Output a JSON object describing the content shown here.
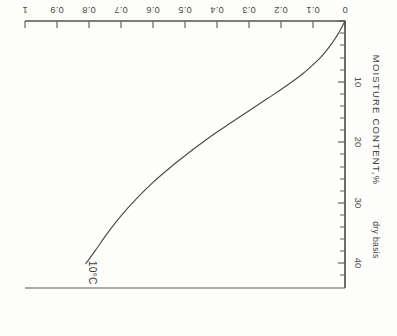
{
  "chart_data": {
    "type": "line",
    "title": "",
    "subtitle": "",
    "xlabel": "a",
    "xlabel_sub": "w",
    "xlabel_full": "a_w",
    "ylabel": "MOISTURE CONTENT,%",
    "ylabel_tail": "dry basis",
    "ylabel_full": "MOISTURE CONTENT,% dry basis",
    "xlim": [
      0,
      1
    ],
    "ylim": [
      0,
      44
    ],
    "grid": false,
    "legend": null,
    "rotation_degrees": 180,
    "xticks": [
      0,
      0.1,
      0.2,
      0.3,
      0.4,
      0.5,
      0.6,
      0.7,
      0.8,
      0.9,
      1
    ],
    "xticklabels": [
      "0",
      "0.1",
      "0.2",
      "0.3",
      "0.4",
      "0.5",
      "0.6",
      "0.7",
      "0.8",
      "0.9",
      "1"
    ],
    "yticks_major": [
      10,
      20,
      30,
      40
    ],
    "yticklabels": [
      "10",
      "20",
      "30",
      "40"
    ],
    "yticks_minor": [
      2,
      4,
      6,
      8,
      12,
      14,
      16,
      18,
      22,
      24,
      26,
      28,
      32,
      34,
      36,
      38,
      42
    ],
    "annotations": [
      {
        "text": "10°C",
        "x": 0.8,
        "y": 41.5,
        "name": "temperature-annotation"
      }
    ],
    "series": [
      {
        "name": "sorption isotherm 10°C",
        "color": "#4a4a46",
        "x": [
          0.0,
          0.02,
          0.04,
          0.06,
          0.08,
          0.1,
          0.13,
          0.16,
          0.2,
          0.24,
          0.28,
          0.32,
          0.36,
          0.4,
          0.45,
          0.5,
          0.55,
          0.6,
          0.65,
          0.7,
          0.74,
          0.78,
          0.81
        ],
        "y": [
          0.0,
          2.0,
          3.6,
          5.0,
          6.2,
          7.2,
          8.6,
          9.8,
          11.3,
          12.7,
          14.1,
          15.5,
          16.9,
          18.3,
          20.2,
          22.2,
          24.3,
          26.6,
          29.2,
          32.1,
          34.8,
          37.8,
          40.0
        ]
      }
    ]
  },
  "figure": {
    "background_color": "#fdfdfc",
    "line_color": "#4a4a46",
    "frame_color": "#5a5a58",
    "text_color": "#45443e"
  }
}
